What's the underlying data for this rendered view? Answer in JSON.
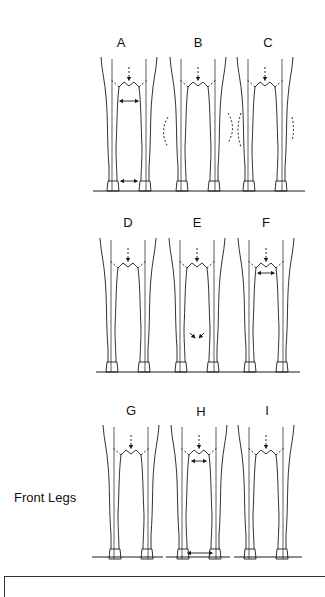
{
  "figure": {
    "side_label": "Front Legs",
    "panels": [
      {
        "id": "A",
        "label": "A",
        "cx": 129,
        "row": 0,
        "type": "base-narrow",
        "arrows": [
          "knee-width",
          "hoof-gap"
        ]
      },
      {
        "id": "B",
        "label": "B",
        "cx": 198,
        "row": 0,
        "type": "bow-out",
        "arrows": []
      },
      {
        "id": "C",
        "label": "C",
        "cx": 265,
        "row": 0,
        "type": "bow-right",
        "arrows": []
      },
      {
        "id": "D",
        "label": "D",
        "cx": 128,
        "row": 1,
        "type": "narrow",
        "arrows": []
      },
      {
        "id": "E",
        "label": "E",
        "cx": 197,
        "row": 1,
        "type": "knock-knee",
        "arrows": [
          "fetlock-in"
        ]
      },
      {
        "id": "F",
        "label": "F",
        "cx": 266,
        "row": 1,
        "type": "narrow-chest",
        "arrows": [
          "chest-width"
        ]
      },
      {
        "id": "G",
        "label": "G",
        "cx": 131,
        "row": 2,
        "type": "toe-in",
        "arrows": []
      },
      {
        "id": "H",
        "label": "H",
        "cx": 199,
        "row": 2,
        "type": "wide",
        "arrows": [
          "chest-width",
          "hoof-gap"
        ]
      },
      {
        "id": "I",
        "label": "I",
        "cx": 266,
        "row": 2,
        "type": "toe-out",
        "arrows": []
      }
    ],
    "colors": {
      "line": "#1a1a1a",
      "background": "#ffffff"
    }
  }
}
